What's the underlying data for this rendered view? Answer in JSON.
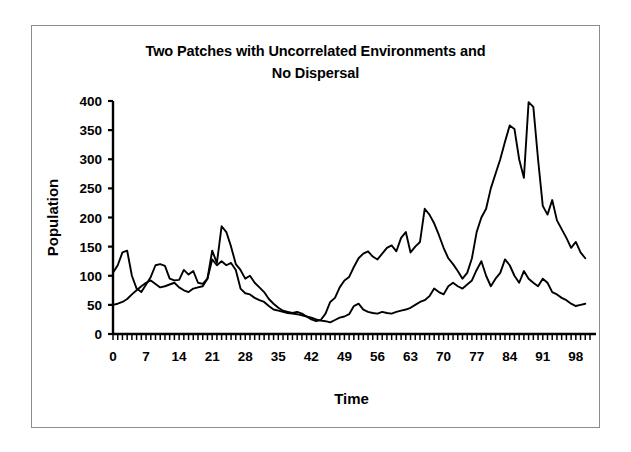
{
  "chart_data": {
    "type": "line",
    "title": "Two Patches with Uncorrelated Environments and No Dispersal",
    "title_lines": [
      "Two Patches with Uncorrelated Environments and",
      "No Dispersal"
    ],
    "xlabel": "Time",
    "ylabel": "Population",
    "xlim": [
      0,
      101
    ],
    "ylim": [
      0,
      400
    ],
    "yticks": [
      0,
      50,
      100,
      150,
      200,
      250,
      300,
      350,
      400
    ],
    "ytick_labels": [
      "0",
      "50",
      "100",
      "150",
      "200",
      "250",
      "300",
      "350",
      "400"
    ],
    "xticks": [
      0,
      7,
      14,
      21,
      28,
      35,
      42,
      49,
      56,
      63,
      70,
      77,
      84,
      91,
      98
    ],
    "xtick_labels": [
      "0",
      "7",
      "14",
      "21",
      "28",
      "35",
      "42",
      "49",
      "56",
      "63",
      "70",
      "77",
      "84",
      "91",
      "98"
    ],
    "x_minor_tick_interval": 1,
    "grid": false,
    "legend": false,
    "line_color": "#000000",
    "background_color": "#ffffff",
    "border_color": "#8c8c8c",
    "x": [
      0,
      1,
      2,
      3,
      4,
      5,
      6,
      7,
      8,
      9,
      10,
      11,
      12,
      13,
      14,
      15,
      16,
      17,
      18,
      19,
      20,
      21,
      22,
      23,
      24,
      25,
      26,
      27,
      28,
      29,
      30,
      31,
      32,
      33,
      34,
      35,
      36,
      37,
      38,
      39,
      40,
      41,
      42,
      43,
      44,
      45,
      46,
      47,
      48,
      49,
      50,
      51,
      52,
      53,
      54,
      55,
      56,
      57,
      58,
      59,
      60,
      61,
      62,
      63,
      64,
      65,
      66,
      67,
      68,
      69,
      70,
      71,
      72,
      73,
      74,
      75,
      76,
      77,
      78,
      79,
      80,
      81,
      82,
      83,
      84,
      85,
      86,
      87,
      88,
      89,
      90,
      91,
      92,
      93,
      94,
      95,
      96,
      97,
      98,
      99,
      100
    ],
    "series": [
      {
        "name": "Patch 1",
        "values": [
          105,
          118,
          140,
          143,
          100,
          78,
          72,
          85,
          98,
          118,
          120,
          117,
          95,
          92,
          93,
          110,
          102,
          108,
          88,
          86,
          95,
          143,
          122,
          185,
          175,
          150,
          120,
          110,
          95,
          100,
          88,
          80,
          72,
          60,
          52,
          45,
          40,
          38,
          36,
          38,
          35,
          30,
          25,
          22,
          24,
          35,
          55,
          62,
          80,
          92,
          98,
          115,
          130,
          138,
          142,
          133,
          128,
          138,
          148,
          152,
          142,
          165,
          175,
          140,
          150,
          158,
          215,
          205,
          190,
          170,
          148,
          130,
          120,
          108,
          95,
          105,
          130,
          175,
          200,
          215,
          250,
          275,
          300,
          330,
          358,
          352,
          300,
          268,
          398,
          390,
          300,
          220,
          205,
          230,
          195,
          180,
          165,
          148,
          158,
          140,
          130
        ]
      },
      {
        "name": "Patch 2",
        "values": [
          50,
          52,
          55,
          60,
          68,
          75,
          82,
          88,
          92,
          86,
          80,
          82,
          85,
          88,
          80,
          75,
          72,
          78,
          80,
          82,
          95,
          128,
          118,
          125,
          118,
          122,
          110,
          78,
          70,
          68,
          62,
          58,
          55,
          48,
          42,
          40,
          38,
          36,
          35,
          34,
          32,
          30,
          28,
          25,
          23,
          22,
          20,
          24,
          28,
          30,
          34,
          48,
          52,
          42,
          38,
          36,
          35,
          38,
          36,
          35,
          38,
          40,
          42,
          45,
          50,
          55,
          58,
          65,
          78,
          72,
          68,
          82,
          88,
          82,
          78,
          85,
          92,
          110,
          125,
          100,
          82,
          95,
          105,
          128,
          118,
          100,
          88,
          108,
          95,
          88,
          82,
          95,
          88,
          72,
          68,
          62,
          58,
          52,
          48,
          50,
          52
        ]
      }
    ]
  }
}
